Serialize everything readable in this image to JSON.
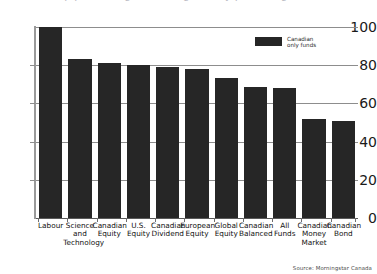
{
  "chart_data": {
    "type": "bar",
    "title": "",
    "xlabel": "",
    "ylabel": "",
    "ylim": [
      0,
      100
    ],
    "yticks": [
      0,
      20,
      40,
      60,
      80,
      100
    ],
    "grid": "horizontal",
    "legend_position": "top-right-inside",
    "bar_color": "#262626",
    "categories": [
      "Labour",
      "Science and Technology",
      "Canadian Equity",
      "U.S. Equity",
      "Canadian Dividend",
      "European Equity",
      "Global Equity",
      "Canadian Balanced",
      "All Funds",
      "Canadian Money Market",
      "Canadian Bond"
    ],
    "category_lines": [
      [
        "Labour"
      ],
      [
        "Science",
        "and",
        "Technology"
      ],
      [
        "Canadian",
        "Equity"
      ],
      [
        "U.S.",
        "Equity"
      ],
      [
        "Canadian",
        "Dividend"
      ],
      [
        "European",
        "Equity"
      ],
      [
        "Global",
        "Equity"
      ],
      [
        "Canadian",
        "Balanced"
      ],
      [
        "All",
        "Funds"
      ],
      [
        "Canadian",
        "Money",
        "Market"
      ],
      [
        "Canadian",
        "Bond"
      ]
    ],
    "values": [
      100,
      83,
      81,
      80,
      79,
      78,
      73.5,
      68.5,
      68,
      52,
      51
    ],
    "series": [
      {
        "name": "Canadian only funds",
        "values": [
          100,
          83,
          81,
          80,
          79,
          78,
          73.5,
          68.5,
          68,
          52,
          51
        ]
      }
    ]
  },
  "legend": {
    "label": "Canadian\nonly funds"
  },
  "footer": {
    "source": "Source: Morningstar Canada"
  },
  "title_remnant": {
    "text": "Top performing fund categories by percentage"
  }
}
